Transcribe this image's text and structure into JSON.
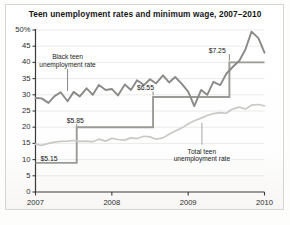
{
  "chart_data": {
    "type": "line",
    "title": "Teen unemployment rates and minimum wage, 2007–2010",
    "xlabel": "",
    "ylabel": "",
    "ylim": [
      0,
      50
    ],
    "xlim": [
      2007,
      2010
    ],
    "grid": true,
    "legend_position": "inline-annotations",
    "y_ticks": [
      "50%",
      "45",
      "40",
      "35",
      "30",
      "25",
      "20",
      "15",
      "10",
      "5",
      "0"
    ],
    "y_tick_values": [
      50,
      45,
      40,
      35,
      30,
      25,
      20,
      15,
      10,
      5,
      0
    ],
    "x_ticks": [
      "2007",
      "2008",
      "2009",
      "2010"
    ],
    "x_tick_values": [
      2007,
      2008,
      2009,
      2010
    ],
    "annotations": [
      {
        "name": "black-teen-label",
        "text_line1": "Black teen",
        "text_line2": "unemployment rate",
        "x": 2007.42,
        "y": 40.5
      },
      {
        "name": "total-teen-label",
        "text_line1": "Total teen",
        "text_line2": "unemployment rate",
        "x": 2009.18,
        "y": 12.5
      },
      {
        "name": "wage-515-label",
        "text": "$5.15",
        "x": 2007.04,
        "y": 10.3
      },
      {
        "name": "wage-585-label",
        "text": "$5.85",
        "x": 2007.52,
        "y": 22.0
      },
      {
        "name": "wage-655-label",
        "text": "$6.55",
        "x": 2008.44,
        "y": 32.0
      },
      {
        "name": "wage-725-label",
        "text": "$7.25",
        "x": 2009.38,
        "y": 43.5
      }
    ],
    "series": [
      {
        "name": "Black teen unemployment rate",
        "color": "#8a8a88",
        "linewidth": 1.9,
        "x": [
          2007.0,
          2007.08,
          2007.17,
          2007.25,
          2007.33,
          2007.42,
          2007.5,
          2007.58,
          2007.67,
          2007.75,
          2007.83,
          2007.92,
          2008.0,
          2008.08,
          2008.17,
          2008.25,
          2008.33,
          2008.42,
          2008.5,
          2008.58,
          2008.67,
          2008.75,
          2008.83,
          2008.92,
          2009.0,
          2009.08,
          2009.17,
          2009.25,
          2009.33,
          2009.42,
          2009.5,
          2009.58,
          2009.67,
          2009.75,
          2009.83,
          2009.92,
          2010.0
        ],
        "values": [
          29.0,
          28.9,
          27.5,
          29.6,
          30.8,
          28.0,
          30.9,
          29.5,
          32.0,
          30.0,
          33.0,
          31.5,
          31.8,
          29.8,
          33.2,
          31.5,
          34.5,
          33.0,
          34.8,
          33.5,
          36.0,
          33.8,
          35.5,
          33.3,
          31.0,
          26.5,
          31.5,
          30.0,
          34.0,
          33.0,
          36.5,
          38.5,
          40.5,
          44.0,
          49.5,
          47.5,
          43.0
        ]
      },
      {
        "name": "Total teen unemployment rate",
        "color": "#c9c9c6",
        "linewidth": 1.7,
        "x": [
          2007.0,
          2007.08,
          2007.17,
          2007.25,
          2007.33,
          2007.42,
          2007.5,
          2007.58,
          2007.67,
          2007.75,
          2007.83,
          2007.92,
          2008.0,
          2008.08,
          2008.17,
          2008.25,
          2008.33,
          2008.42,
          2008.5,
          2008.58,
          2008.67,
          2008.75,
          2008.83,
          2008.92,
          2009.0,
          2009.08,
          2009.17,
          2009.25,
          2009.33,
          2009.42,
          2009.5,
          2009.58,
          2009.67,
          2009.75,
          2009.83,
          2009.92,
          2010.0
        ],
        "values": [
          14.8,
          14.4,
          15.0,
          15.4,
          15.6,
          15.7,
          15.9,
          15.6,
          15.7,
          15.5,
          16.3,
          15.7,
          16.6,
          16.2,
          16.0,
          16.7,
          16.5,
          17.2,
          17.0,
          16.3,
          16.7,
          17.8,
          18.8,
          19.8,
          21.0,
          22.0,
          22.8,
          23.6,
          24.2,
          24.5,
          24.3,
          25.6,
          26.2,
          25.6,
          26.8,
          27.0,
          26.6
        ]
      },
      {
        "name": "Federal minimum wage (step)",
        "color": "#9a9a97",
        "linewidth": 1.9,
        "step": true,
        "wage_levels": [
          {
            "wage": 5.15,
            "start": 2007.0,
            "end": 2007.54,
            "plot_y": 9.0
          },
          {
            "wage": 5.85,
            "start": 2007.54,
            "end": 2008.54,
            "plot_y": 20.0
          },
          {
            "wage": 6.55,
            "start": 2008.54,
            "end": 2009.54,
            "plot_y": 29.3
          },
          {
            "wage": 7.25,
            "start": 2009.54,
            "end": 2010.0,
            "plot_y": 40.0
          }
        ]
      }
    ]
  },
  "colors": {
    "black_teen_line": "#8a8a88",
    "total_teen_line": "#c9c9c6",
    "wage_step_line": "#9a9a97",
    "grid": "#e3e2df",
    "axis": "#3a3a3a",
    "text": "#1a1a1a",
    "background": "#fdfdfc"
  }
}
